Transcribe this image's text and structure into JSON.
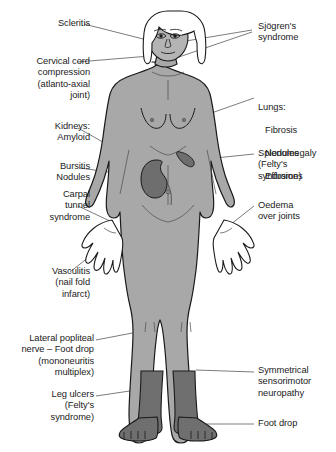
{
  "figure": {
    "colors": {
      "skin_fill": "#a8a8a8",
      "skin_light": "#b4b4b4",
      "hair_fill": "#ffffff",
      "organ_fill": "#6e6e6e",
      "stocking_fill": "#6f6f6f",
      "outline": "#1a1a1a",
      "leader_line": "#5a5a5a",
      "text": "#1b1b1b",
      "background": "#ffffff"
    }
  },
  "labels": {
    "scleritis": {
      "text": "Scleritis",
      "side": "left"
    },
    "cervical_cord": {
      "text": "Cervical cord\ncompression\n(atlanto-axial\njoint)",
      "side": "left"
    },
    "kidneys": {
      "text": "Kidneys:\nAmyloid",
      "side": "left"
    },
    "bursitis": {
      "text": "Bursitis\nNodules",
      "side": "left"
    },
    "carpal": {
      "text": "Carpal\ntunnel\nsyndrome",
      "side": "left"
    },
    "vasculitis": {
      "text": "Vasculitis\n(nail fold\ninfarct)",
      "side": "left"
    },
    "lateral_popliteal": {
      "text": "Lateral popliteal\nnerve – Foot drop\n(mononeuritis\nmultiplex)",
      "side": "left"
    },
    "leg_ulcers": {
      "text": "Leg ulcers\n(Felty's\nsyndrome)",
      "side": "left"
    },
    "sjogrens": {
      "text": "Sjögren's\nsyndrome",
      "side": "right"
    },
    "lungs_head": {
      "text": "Lungs:",
      "side": "right"
    },
    "lungs_item1": {
      "text": "Fibrosis",
      "side": "right"
    },
    "lungs_item2": {
      "text": "Nodules",
      "side": "right"
    },
    "lungs_item3": {
      "text": "Effusions",
      "side": "right"
    },
    "splenomegaly": {
      "text": "Splenomegaly\n(Felty's\nsyndrome)",
      "side": "right"
    },
    "oedema": {
      "text": "Oedema\nover joints",
      "side": "right"
    },
    "symmetrical": {
      "text": "Symmetrical\nsensorimotor\nneuropathy",
      "side": "right"
    },
    "foot_drop": {
      "text": "Foot drop",
      "side": "right"
    }
  }
}
